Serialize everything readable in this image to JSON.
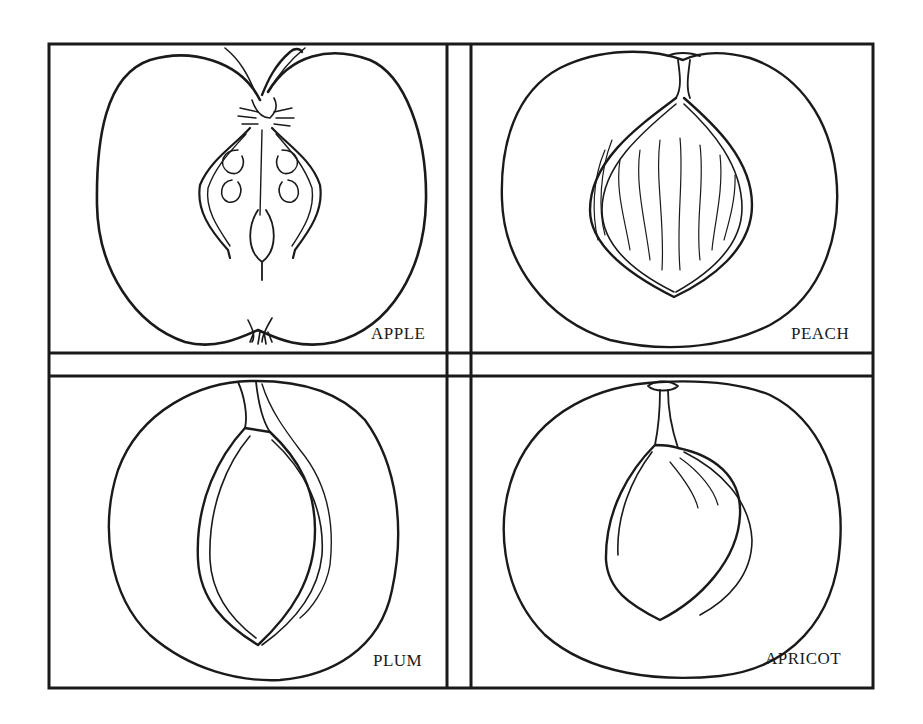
{
  "figure": {
    "panels": [
      {
        "id": "apple",
        "label": "APPLE",
        "position": "top-left"
      },
      {
        "id": "peach",
        "label": "PEACH",
        "position": "top-right"
      },
      {
        "id": "plum",
        "label": "PLUM",
        "position": "bottom-left"
      },
      {
        "id": "apricot",
        "label": "APRICOT",
        "position": "bottom-right"
      }
    ],
    "colors": {
      "ink": "#1a1a1a",
      "background": "#ffffff"
    }
  }
}
